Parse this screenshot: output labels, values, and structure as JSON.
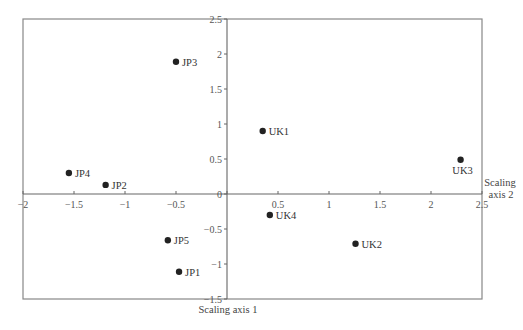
{
  "chart_data": {
    "type": "scatter",
    "title": "",
    "xlabel": "Scaling axis 1",
    "ylabel": "Scaling axis 2",
    "xlim": [
      -2,
      2.5
    ],
    "ylim": [
      -1.5,
      2.5
    ],
    "grid": false,
    "legend": null,
    "x_ticks": [
      -2,
      -1.5,
      -1,
      -0.5,
      0,
      0.5,
      1,
      1.5,
      2,
      2.5
    ],
    "x_tick_labels": [
      "-2",
      "-1.5",
      "-1",
      "-0.5",
      "",
      "0.5",
      "1",
      "1.5",
      "2",
      "2.5"
    ],
    "y_ticks": [
      -1.5,
      -1,
      -0.5,
      0,
      0.5,
      1,
      1.5,
      2,
      2.5
    ],
    "y_tick_labels": [
      "-1.5",
      "-1",
      "-0.5",
      "0",
      "0.5",
      "1",
      "1.5",
      "2",
      "2.5"
    ],
    "points": [
      {
        "label": "JP1",
        "x": -0.47,
        "y": -1.11,
        "label_pos": "right"
      },
      {
        "label": "JP2",
        "x": -1.19,
        "y": 0.13,
        "label_pos": "right"
      },
      {
        "label": "JP3",
        "x": -0.5,
        "y": 1.89,
        "label_pos": "right"
      },
      {
        "label": "JP4",
        "x": -1.55,
        "y": 0.3,
        "label_pos": "right"
      },
      {
        "label": "JP5",
        "x": -0.58,
        "y": -0.66,
        "label_pos": "right"
      },
      {
        "label": "UK1",
        "x": 0.35,
        "y": 0.9,
        "label_pos": "right"
      },
      {
        "label": "UK2",
        "x": 1.26,
        "y": -0.71,
        "label_pos": "right"
      },
      {
        "label": "UK3",
        "x": 2.29,
        "y": 0.49,
        "label_pos": "below"
      },
      {
        "label": "UK4",
        "x": 0.42,
        "y": -0.3,
        "label_pos": "right"
      }
    ]
  },
  "axes": {
    "x_title": "Scaling axis 1",
    "y_title_line1": "Scaling",
    "y_title_line2": "axis 2"
  },
  "colors": {
    "frame": "#777777",
    "axis": "#666666",
    "point": "#222222",
    "text": "#333333"
  }
}
